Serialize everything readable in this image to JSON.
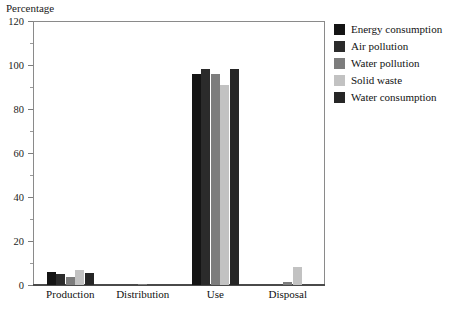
{
  "chart_data": {
    "type": "bar",
    "title": "Percentage",
    "xlabel": "",
    "ylabel": "",
    "ylim": [
      0,
      120
    ],
    "ytick_step": 20,
    "yticks": [
      0,
      20,
      40,
      60,
      80,
      100,
      120
    ],
    "yminor_step": 10,
    "grid": false,
    "legend_position": "right-outside",
    "categories": [
      "Production",
      "Distribution",
      "Use",
      "Disposal"
    ],
    "series": [
      {
        "name": "Energy consumption",
        "color": "#141414",
        "values": [
          6,
          0,
          96,
          0
        ]
      },
      {
        "name": "Air pollution",
        "color": "#2b2b2b",
        "values": [
          5,
          0,
          98,
          0
        ]
      },
      {
        "name": "Water pollution",
        "color": "#7d7d7d",
        "values": [
          3.5,
          0.5,
          96,
          1.5
        ]
      },
      {
        "name": "Solid waste",
        "color": "#c2c2c2",
        "values": [
          7,
          0,
          91,
          8
        ]
      },
      {
        "name": "Water consumption",
        "color": "#262626",
        "values": [
          5.5,
          0,
          98,
          0
        ]
      }
    ]
  },
  "axis": {
    "tick_labels": [
      "0",
      "20",
      "40",
      "60",
      "80",
      "100",
      "120"
    ]
  },
  "legend": {
    "items": [
      {
        "label": "Energy consumption"
      },
      {
        "label": "Air pollution"
      },
      {
        "label": "Water pollution"
      },
      {
        "label": "Solid waste"
      },
      {
        "label": "Water consumption"
      }
    ]
  }
}
